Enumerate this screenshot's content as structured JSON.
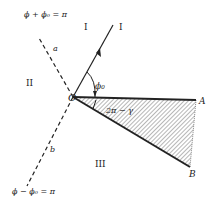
{
  "diagram": {
    "type": "wedge-geometry",
    "points": {
      "origin": {
        "label": "O",
        "x": 73,
        "y": 97
      },
      "A": {
        "label": "A",
        "x": 196,
        "y": 100
      },
      "B": {
        "label": "B",
        "x": 188,
        "y": 167
      }
    },
    "regions": {
      "I": "I",
      "II": "II",
      "III": "III"
    },
    "incident_ray_label": "I",
    "dashed_lines": {
      "upper": {
        "label": "a",
        "equation": "ϕ + ϕ₀ = π"
      },
      "lower": {
        "label": "b",
        "equation": "ϕ − ϕ₀ = π"
      }
    },
    "angles": {
      "incidence": "ϕ₀",
      "wedge": "2π − γ"
    },
    "colors": {
      "ink": "#222222",
      "background": "#ffffff",
      "hatch": "#555555"
    }
  }
}
